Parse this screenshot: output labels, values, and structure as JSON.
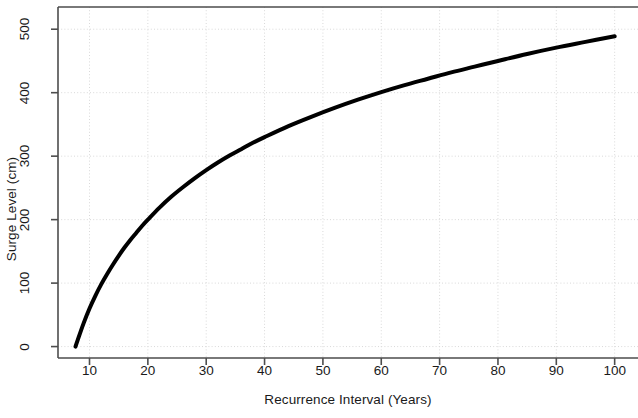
{
  "chart_data": {
    "type": "line",
    "title": "",
    "xlabel": "Recurrence Interval (Years)",
    "ylabel": "Surge Level (cm)",
    "xlim": [
      4.6,
      104
    ],
    "ylim": [
      -18,
      535
    ],
    "xticks": [
      10,
      20,
      30,
      40,
      50,
      60,
      70,
      80,
      90,
      100
    ],
    "xtick_labels": [
      "10",
      "20",
      "30",
      "40",
      "50",
      "60",
      "70",
      "80",
      "90",
      "100"
    ],
    "yticks": [
      0,
      100,
      200,
      300,
      400,
      500
    ],
    "ytick_labels": [
      "0",
      "100",
      "200",
      "300",
      "400",
      "500"
    ],
    "grid": true,
    "grid_style": "dotted",
    "grid_color": "#d9d9d9",
    "legend": null,
    "line_color": "#000000",
    "line_width": 4,
    "series": [
      {
        "name": "Surge Level",
        "x": [
          7.6,
          8,
          9,
          10,
          11,
          12,
          13,
          14,
          15,
          16,
          17,
          18,
          19,
          20,
          22,
          24,
          26,
          28,
          30,
          32,
          34,
          36,
          38,
          40,
          44,
          48,
          52,
          56,
          60,
          64,
          68,
          72,
          76,
          80,
          85,
          90,
          95,
          100
        ],
        "y": [
          0,
          11,
          37,
          60,
          80,
          98,
          114,
          129,
          143,
          156,
          168,
          179,
          190,
          200,
          219,
          236,
          251,
          265,
          278,
          290,
          301,
          311,
          321,
          330,
          347,
          362,
          376,
          389,
          401,
          412,
          422,
          432,
          441,
          450,
          461,
          471,
          480,
          489
        ]
      }
    ]
  },
  "axis": {
    "x_axis_name": "recurrence-interval-axis",
    "y_axis_name": "surge-level-axis"
  }
}
